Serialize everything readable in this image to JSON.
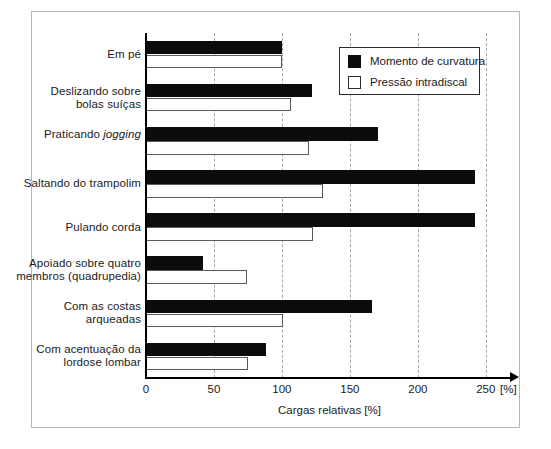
{
  "chart_data": {
    "type": "bar",
    "orientation": "horizontal",
    "title": "",
    "xlabel": "Cargas relativas [%]",
    "ylabel": "",
    "x_unit_label": "[%]",
    "xlim": [
      0,
      270
    ],
    "xticks": [
      0,
      50,
      100,
      150,
      200,
      250
    ],
    "xtick_labels": [
      "0",
      "50",
      "100",
      "150",
      "200",
      "250"
    ],
    "gridlines": [
      50,
      100,
      150,
      200,
      250
    ],
    "grid": true,
    "grid_style": "dashed",
    "legend_position": "top-right",
    "categories": [
      "Em pé",
      "Deslizando sobre bolas suíças",
      "Praticando jogging",
      "Saltando do trampolim",
      "Pulando corda",
      "Apoiado sobre quatro membros (quadrupedia)",
      "Com as costas arqueadas",
      "Com acentuação da lordose lombar"
    ],
    "category_lines": [
      [
        "Em pé"
      ],
      [
        "Deslizando sobre",
        "bolas suíças"
      ],
      [
        "Praticando ",
        "jogging"
      ],
      [
        "Saltando do trampolim"
      ],
      [
        "Pulando corda"
      ],
      [
        "Apoiado sobre quatro",
        "membros (quadrupedia)"
      ],
      [
        "Com as costas",
        "arqueadas"
      ],
      [
        "Com acentuação da",
        "lordose lombar"
      ]
    ],
    "series": [
      {
        "name": "Momento de curvatura",
        "color": "#0c0c0c",
        "values": [
          100,
          122,
          171,
          242,
          242,
          42,
          166,
          88
        ]
      },
      {
        "name": "Pressão intradiscal",
        "color": "#ffffff",
        "values": [
          100,
          107,
          120,
          130,
          123,
          74,
          101,
          75
        ]
      }
    ]
  },
  "legend": {
    "items": [
      {
        "label": "Momento de curvatura",
        "swatch": "dark"
      },
      {
        "label": "Pressão intradiscal",
        "swatch": "light"
      }
    ]
  },
  "axis": {
    "x_title": "Cargas relativas [%]",
    "x_unit": "[%]",
    "ticks": [
      "0",
      "50",
      "100",
      "150",
      "200",
      "250"
    ]
  }
}
